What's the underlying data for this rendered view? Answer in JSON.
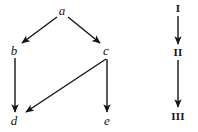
{
  "figure": {
    "background_color": "#ffffff",
    "ink_color": "#151515",
    "width": 198,
    "height": 132
  },
  "graphs": [
    {
      "id": "lattice-graph",
      "name": "letter-dag",
      "label_style": "italic-lowercase",
      "nodes": [
        {
          "id": "a",
          "label": "a",
          "x": 62,
          "y": 10
        },
        {
          "id": "b",
          "label": "b",
          "x": 14,
          "y": 50
        },
        {
          "id": "c",
          "label": "c",
          "x": 106,
          "y": 50
        },
        {
          "id": "d",
          "label": "d",
          "x": 14,
          "y": 120
        },
        {
          "id": "e",
          "label": "e",
          "x": 107,
          "y": 120
        }
      ],
      "edges": [
        {
          "id": "a-b",
          "from": "a",
          "to": "b",
          "x1": 57,
          "y1": 17,
          "x2": 22,
          "y2": 43
        },
        {
          "id": "a-c",
          "from": "a",
          "to": "c",
          "x1": 68,
          "y1": 17,
          "x2": 100,
          "y2": 43
        },
        {
          "id": "b-d",
          "from": "b",
          "to": "d",
          "x1": 15,
          "y1": 58,
          "x2": 15,
          "y2": 112
        },
        {
          "id": "c-d",
          "from": "c",
          "to": "d",
          "x1": 106,
          "y1": 59,
          "x2": 26,
          "y2": 112
        },
        {
          "id": "c-e",
          "from": "c",
          "to": "e",
          "x1": 107,
          "y1": 59,
          "x2": 107,
          "y2": 112
        }
      ]
    },
    {
      "id": "chain-graph",
      "name": "roman-numeral-chain",
      "label_style": "bold-roman-numeral",
      "nodes": [
        {
          "id": "I",
          "label": "I",
          "x": 178,
          "y": 8
        },
        {
          "id": "II",
          "label": "II",
          "x": 178,
          "y": 52
        },
        {
          "id": "III",
          "label": "III",
          "x": 178,
          "y": 116
        }
      ],
      "edges": [
        {
          "id": "I-II",
          "from": "I",
          "to": "II",
          "x1": 178,
          "y1": 16,
          "x2": 178,
          "y2": 44
        },
        {
          "id": "II-III",
          "from": "II",
          "to": "III",
          "x1": 178,
          "y1": 60,
          "x2": 178,
          "y2": 107
        }
      ]
    }
  ]
}
